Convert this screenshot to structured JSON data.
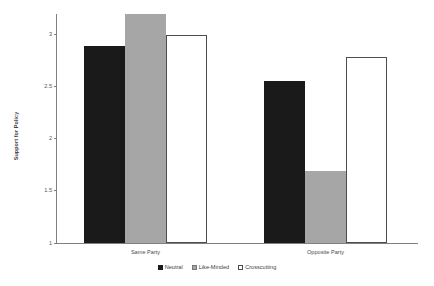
{
  "chart_data": {
    "type": "bar",
    "title": "",
    "xlabel": "",
    "ylabel": "Support for Policy",
    "categories": [
      "Same Party",
      "Opposite Party"
    ],
    "series": [
      {
        "name": "Neutral",
        "color": "#1a1a1a",
        "values": [
          2.89,
          2.56
        ]
      },
      {
        "name": "Like-Minded",
        "color": "#a6a6a6",
        "values": [
          3.2,
          1.69
        ]
      },
      {
        "name": "Crosscutting",
        "color": "#ffffff",
        "values": [
          3.0,
          2.79
        ]
      }
    ],
    "ylim": [
      1,
      3.2
    ],
    "yticks": [
      1,
      1.5,
      2,
      2.5,
      3
    ],
    "ytick_labels": [
      "1",
      "1.5",
      "2",
      "2.5",
      "3"
    ],
    "grid": false,
    "legend_position": "bottom"
  },
  "axis": {
    "y_title": "Support for Policy"
  }
}
